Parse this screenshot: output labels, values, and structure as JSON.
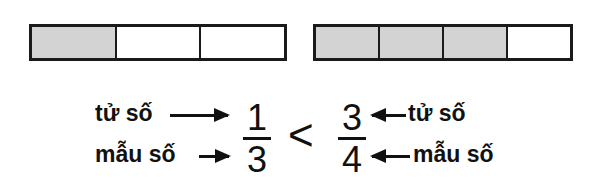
{
  "diagram": {
    "title": "",
    "bars": [
      {
        "name": "one-third",
        "cells": 3,
        "shaded": 1,
        "fill_color": "#d3d3d3"
      },
      {
        "name": "three-quarters",
        "cells": 4,
        "shaded": 3,
        "fill_color": "#d3d3d3"
      }
    ],
    "left_fraction": {
      "numerator": "1",
      "denominator": "3"
    },
    "right_fraction": {
      "numerator": "3",
      "denominator": "4"
    },
    "comparison": "<",
    "labels": {
      "numerator": "tử số",
      "denominator": "mẫu số"
    }
  }
}
